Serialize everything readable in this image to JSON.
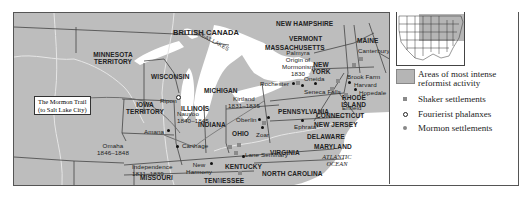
{
  "map": {
    "region_labels": {
      "british_canada": "BRITISH CANADA",
      "new_hampshire": "NEW HAMPSHIRE",
      "vermont": "VERMONT",
      "massachusetts": "MASSACHUSETTS",
      "maine": "MAINE",
      "new_york": "NEW YORK",
      "minnesota": "MINNESOTA TERRITORY",
      "wisconsin": "WISCONSIN",
      "michigan": "MICHIGAN",
      "iowa": "IOWA TERRITORY",
      "illinois": "ILLINOIS",
      "indiana": "INDIANA",
      "ohio": "OHIO",
      "pennsylvania": "PENNSYLVANIA",
      "connecticut": "CONNECTICUT",
      "rhode_island": "RHODE ISLAND",
      "new_jersey": "NEW JERSEY",
      "delaware": "DELAWARE",
      "maryland": "MARYLAND",
      "virginia": "VIRGINIA",
      "kentucky": "KENTUCKY",
      "missouri": "MISSOURI",
      "tennessee": "TENNESSEE",
      "north_carolina": "NORTH CAROLINA",
      "arkansas": "ARKANSAS",
      "great_lakes": "GREAT LAKES",
      "atlantic": "ATLANTIC OCEAN"
    },
    "places": {
      "palmyra": "Palmyra",
      "palmyra_note": "Origin of Mormonism",
      "palmyra_year": "1830",
      "rochester": "Rochester",
      "oneida": "Oneida",
      "seneca_falls": "Seneca Falls",
      "canterbury": "Canterbury",
      "brook_farm": "Brook Farm",
      "harvard": "Harvard",
      "hopedale": "Hopedale",
      "enfield": "Enfield",
      "ripon": "Ripon",
      "kirtland": "Kirtland",
      "kirtland_years": "1831–1835",
      "oberlin": "Oberlin",
      "zoar": "Zoar",
      "ephrata": "Ephrata",
      "lane_seminary": "Lane Seminary",
      "amana": "Amana",
      "nauvoo": "Nauvoo",
      "nauvoo_years": "1840–1845",
      "carthage": "Carthage",
      "omaha": "Omaha",
      "omaha_years": "1846–1848",
      "independence": "Independence",
      "independence_years": "1831–1839",
      "new_harmony": "New Harmony"
    },
    "callout": {
      "line1": "The Mormon Trail",
      "line2": "(to Salt Lake City)"
    }
  },
  "legend": {
    "items": [
      {
        "symbol": "shaded-area",
        "label_line1": "Areas  of most intense",
        "label_line2": "reformist activity"
      },
      {
        "symbol": "gray-square",
        "label": "Shaker settlements"
      },
      {
        "symbol": "open-circle",
        "label": "Fourierist phalanxes"
      },
      {
        "symbol": "gray-dot",
        "label": "Mormon settlements"
      }
    ]
  },
  "colors": {
    "land": "#bdbdbd",
    "water": "#ffffff",
    "border": "#444444",
    "shaded_area": "#b5b5b5"
  }
}
